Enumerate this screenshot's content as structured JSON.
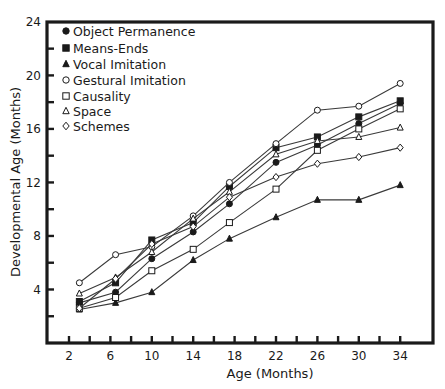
{
  "chart_data": {
    "type": "line",
    "title": "",
    "xlabel": "Age (Months)",
    "ylabel": "Developmental Age (Months)",
    "xlim": [
      0,
      37
    ],
    "ylim": [
      0,
      24
    ],
    "x_ticks": [
      "2",
      "6",
      "10",
      "14",
      "18",
      "22",
      "26",
      "30",
      "34"
    ],
    "x_tick_values": [
      2,
      6,
      10,
      14,
      18,
      22,
      26,
      30,
      34
    ],
    "x_minor_ticks": [
      4,
      8,
      12,
      16,
      20,
      24,
      28,
      32
    ],
    "y_ticks": [
      "4",
      "8",
      "12",
      "16",
      "20",
      "24"
    ],
    "y_tick_values": [
      4,
      8,
      12,
      16,
      20,
      24
    ],
    "y_minor_ticks": [
      2,
      6,
      10,
      14,
      18,
      22
    ],
    "grid": false,
    "legend_position": "top-left",
    "x": [
      3,
      6.5,
      10,
      14,
      17.5,
      22,
      26,
      30,
      34
    ],
    "series": [
      {
        "name": "Object Permanence",
        "marker": "filled-circle",
        "values": [
          3.0,
          3.8,
          6.3,
          8.3,
          10.4,
          13.5,
          14.8,
          16.4,
          17.9
        ]
      },
      {
        "name": "Means-Ends",
        "marker": "filled-square",
        "values": [
          3.1,
          4.5,
          7.7,
          9.0,
          11.7,
          14.6,
          15.4,
          16.9,
          18.1
        ]
      },
      {
        "name": "Vocal Imitation",
        "marker": "filled-triangle",
        "values": [
          2.5,
          3.0,
          3.8,
          6.2,
          7.8,
          9.4,
          10.7,
          10.7,
          11.8
        ]
      },
      {
        "name": "Gestural Imitation",
        "marker": "open-circle",
        "values": [
          4.5,
          6.6,
          7.2,
          9.5,
          12.0,
          14.9,
          17.4,
          17.7,
          19.4
        ]
      },
      {
        "name": "Causality",
        "marker": "open-square",
        "values": [
          2.6,
          3.4,
          5.4,
          7.0,
          9.0,
          11.5,
          14.4,
          16.0,
          17.5
        ]
      },
      {
        "name": "Space",
        "marker": "open-triangle",
        "values": [
          3.7,
          4.9,
          6.8,
          9.3,
          11.3,
          14.1,
          15.1,
          15.4,
          16.1
        ]
      },
      {
        "name": "Schemes",
        "marker": "open-diamond",
        "values": [
          2.6,
          4.8,
          7.4,
          8.7,
          10.9,
          12.4,
          13.4,
          13.9,
          14.6
        ]
      }
    ],
    "colors": {
      "ink": "#1a1a1a",
      "line": "#3a3a3a",
      "background": "#ffffff"
    }
  }
}
